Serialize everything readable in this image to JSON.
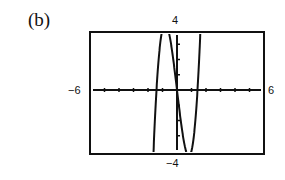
{
  "panel": {
    "label": "(b)"
  },
  "window": {
    "xmin_label": "−6",
    "xmax_label": "6",
    "ymax_label": "4",
    "ymin_label": "−4"
  },
  "chart_data": {
    "type": "line",
    "title": "(b)",
    "xlabel": "",
    "ylabel": "",
    "xlim": [
      -6,
      6
    ],
    "ylim": [
      -4,
      4
    ],
    "x_tick_spacing": 1,
    "y_tick_spacing": 1,
    "grid": false,
    "legend": null,
    "annotations": [
      "−6",
      "6",
      "4",
      "−4"
    ],
    "series": [
      {
        "name": "cubic curve (graphing-calculator display)",
        "description": "Cubic with zeros near x = -1.4, 0, 1.4; local max near x ≈ -0.8 (clipped at y = 4), local min near x ≈ 0.8 (clipped at y = -4); approx y = 4x^3 - 8x",
        "x": [
          -1.6,
          -1.4,
          -1.2,
          -1.0,
          -0.8,
          -0.6,
          -0.4,
          -0.2,
          0.0,
          0.2,
          0.4,
          0.6,
          0.8,
          1.0,
          1.2,
          1.4,
          1.6
        ],
        "y": [
          -3.58,
          0.22,
          2.69,
          4.0,
          4.35,
          3.94,
          2.94,
          1.57,
          0.0,
          -1.57,
          -2.94,
          -3.94,
          -4.35,
          -4.0,
          -2.69,
          -0.22,
          3.58
        ]
      }
    ]
  }
}
